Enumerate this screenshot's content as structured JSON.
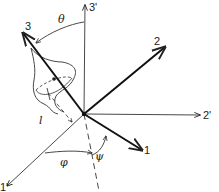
{
  "diagram": {
    "lab_axes": [
      {
        "id": "axis-3prime",
        "label": "3'"
      },
      {
        "id": "axis-2prime",
        "label": "2'"
      },
      {
        "id": "axis-1prime",
        "label": "1'"
      }
    ],
    "body_axes": [
      {
        "id": "axis-3",
        "label": "3"
      },
      {
        "id": "axis-2",
        "label": "2"
      },
      {
        "id": "axis-1",
        "label": "1"
      }
    ],
    "angles": {
      "theta": "θ",
      "phi": "φ",
      "psi": "ψ"
    },
    "length_label": "l",
    "colors": {
      "line": "#222222",
      "background": "#ffffff"
    }
  }
}
